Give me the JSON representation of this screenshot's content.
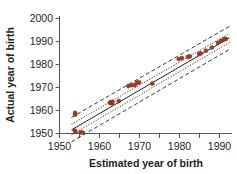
{
  "chart_data": {
    "type": "scatter",
    "title": "",
    "subtitle": "",
    "xlabel": "Estimated year of birth",
    "ylabel": "Actual year of birth",
    "xlim": [
      1950,
      1993
    ],
    "ylim": [
      1948,
      2001
    ],
    "xticks": [
      1950,
      1960,
      1970,
      1980,
      1990
    ],
    "xtick_labels": [
      "1950",
      "1960",
      "1970",
      "1980",
      "1990"
    ],
    "xminor_ticks": [
      1955,
      1965,
      1975,
      1985
    ],
    "yticks": [
      1950,
      1960,
      1970,
      1980,
      1990,
      2000
    ],
    "ytick_labels": [
      "1950",
      "1960",
      "1970",
      "1980",
      "1990",
      "2000"
    ],
    "grid": false,
    "legend": "none",
    "point_color": "#a53a24",
    "line_color": "#231f20",
    "axis_color": "#58595b",
    "series": [
      {
        "name": "Individuals",
        "marker": "circle",
        "points": [
          [
            1953.9,
            1958.2
          ],
          [
            1953.9,
            1959.0
          ],
          [
            1953.8,
            1951.3
          ],
          [
            1954.0,
            1950.7
          ],
          [
            1955.3,
            1950.5
          ],
          [
            1955.8,
            1950.4
          ],
          [
            1962.6,
            1963.3
          ],
          [
            1962.9,
            1963.6
          ],
          [
            1963.1,
            1963.1
          ],
          [
            1963.3,
            1963.8
          ],
          [
            1964.8,
            1964.1
          ],
          [
            1967.2,
            1970.6
          ],
          [
            1968.0,
            1971.0
          ],
          [
            1968.8,
            1971.0
          ],
          [
            1969.4,
            1972.1
          ],
          [
            1969.9,
            1972.2
          ],
          [
            1973.2,
            1971.7
          ],
          [
            1979.8,
            1982.4
          ],
          [
            1980.6,
            1982.8
          ],
          [
            1982.1,
            1983.3
          ],
          [
            1982.6,
            1983.5
          ],
          [
            1984.9,
            1984.6
          ],
          [
            1985.3,
            1984.8
          ],
          [
            1986.6,
            1986.0
          ],
          [
            1988.1,
            1987.4
          ],
          [
            1989.6,
            1989.4
          ],
          [
            1990.4,
            1990.3
          ],
          [
            1991.2,
            1991.0
          ],
          [
            1991.6,
            1991.1
          ]
        ]
      }
    ],
    "fit_line": {
      "name": "regression line",
      "style": "solid",
      "x": [
        1953.0,
        1992.5
      ],
      "y": [
        1951.6,
        1991.6
      ]
    },
    "confidence_band": {
      "name": "confidence interval",
      "style": "dotted",
      "upper": {
        "x": [
          1953.0,
          1992.5
        ],
        "y": [
          1954.0,
          1993.6
        ]
      },
      "lower": {
        "x": [
          1953.0,
          1992.5
        ],
        "y": [
          1949.4,
          1989.6
        ]
      }
    },
    "prediction_band": {
      "name": "prediction interval",
      "style": "dashed",
      "upper": {
        "x": [
          1953.0,
          1992.5
        ],
        "y": [
          1957.0,
          1996.6
        ]
      },
      "lower": {
        "x": [
          1953.0,
          1992.5
        ],
        "y": [
          1946.4,
          1986.6
        ]
      }
    }
  },
  "axes": {
    "x_title": "Estimated year of birth",
    "y_title": "Actual year of birth",
    "x_tick_labels": [
      "1950",
      "1960",
      "1970",
      "1980",
      "1990"
    ],
    "y_tick_labels": [
      "2000",
      "1990",
      "1980",
      "1970",
      "1960",
      "1950"
    ]
  }
}
